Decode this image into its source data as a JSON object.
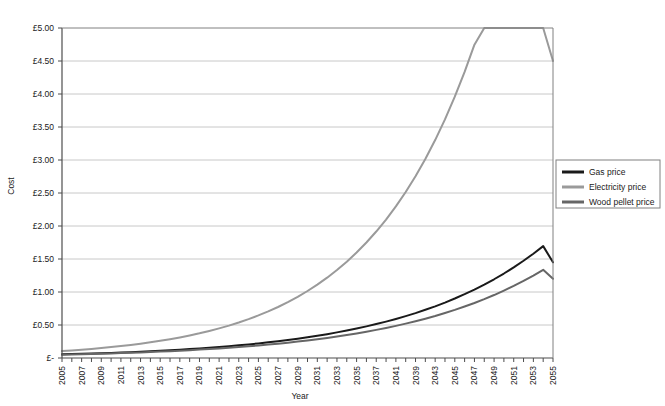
{
  "chart_data": {
    "type": "line",
    "title": "",
    "xlabel": "Year",
    "ylabel": "Cost",
    "ylim": [
      0,
      5
    ],
    "xlim": [
      2005,
      2055
    ],
    "grid": true,
    "grid_axis": "y",
    "legend_position": "right",
    "ytick_labels": [
      "£5.00",
      "£4.50",
      "£4.00",
      "£3.50",
      "£3.00",
      "£2.50",
      "£2.00",
      "£1.50",
      "£1.00",
      "£0.50",
      "£-"
    ],
    "ytick_values": [
      5.0,
      4.5,
      4.0,
      3.5,
      3.0,
      2.5,
      2.0,
      1.5,
      1.0,
      0.5,
      0.0
    ],
    "x": [
      2005,
      2006,
      2007,
      2008,
      2009,
      2010,
      2011,
      2012,
      2013,
      2014,
      2015,
      2016,
      2017,
      2018,
      2019,
      2020,
      2021,
      2022,
      2023,
      2024,
      2025,
      2026,
      2027,
      2028,
      2029,
      2030,
      2031,
      2032,
      2033,
      2034,
      2035,
      2036,
      2037,
      2038,
      2039,
      2040,
      2041,
      2042,
      2043,
      2044,
      2045,
      2046,
      2047,
      2048,
      2049,
      2050,
      2051,
      2052,
      2053,
      2054,
      2055
    ],
    "xtick_labels": [
      "2005",
      "2007",
      "2009",
      "2011",
      "2013",
      "2015",
      "2017",
      "2019",
      "2021",
      "2023",
      "2025",
      "2027",
      "2029",
      "2031",
      "2033",
      "2035",
      "2037",
      "2041",
      "2039",
      "2043",
      "2045",
      "2047",
      "2049",
      "2051",
      "2053",
      "2055"
    ],
    "series": [
      {
        "name": "Gas price",
        "color": "#1a1a1a",
        "values": [
          0.055,
          0.059,
          0.063,
          0.067,
          0.072,
          0.077,
          0.083,
          0.089,
          0.095,
          0.102,
          0.109,
          0.117,
          0.126,
          0.135,
          0.145,
          0.155,
          0.167,
          0.179,
          0.192,
          0.206,
          0.221,
          0.237,
          0.254,
          0.273,
          0.293,
          0.314,
          0.337,
          0.361,
          0.388,
          0.416,
          0.446,
          0.479,
          0.514,
          0.551,
          0.591,
          0.634,
          0.68,
          0.73,
          0.783,
          0.84,
          0.901,
          0.967,
          1.037,
          1.112,
          1.193,
          1.28,
          1.373,
          1.473,
          1.58,
          1.695,
          1.45
        ]
      },
      {
        "name": "Electricity price",
        "color": "#9a9a9a",
        "values": [
          0.105,
          0.115,
          0.126,
          0.138,
          0.151,
          0.165,
          0.181,
          0.198,
          0.217,
          0.238,
          0.26,
          0.285,
          0.312,
          0.342,
          0.374,
          0.41,
          0.449,
          0.491,
          0.538,
          0.589,
          0.645,
          0.706,
          0.773,
          0.847,
          0.927,
          1.015,
          1.112,
          1.217,
          1.333,
          1.459,
          1.598,
          1.75,
          1.916,
          2.098,
          2.297,
          2.515,
          2.754,
          3.015,
          3.302,
          3.615,
          3.959,
          4.335,
          4.747,
          5.198,
          5.692,
          6.233,
          6.825,
          7.473,
          8.183,
          8.96,
          4.5
        ]
      },
      {
        "name": "Wood pellet price",
        "color": "#666666",
        "values": [
          0.05,
          0.053,
          0.057,
          0.061,
          0.065,
          0.07,
          0.074,
          0.08,
          0.085,
          0.091,
          0.097,
          0.104,
          0.111,
          0.119,
          0.127,
          0.136,
          0.145,
          0.155,
          0.166,
          0.178,
          0.19,
          0.203,
          0.217,
          0.232,
          0.249,
          0.266,
          0.284,
          0.304,
          0.325,
          0.348,
          0.372,
          0.398,
          0.426,
          0.455,
          0.487,
          0.521,
          0.557,
          0.596,
          0.637,
          0.682,
          0.729,
          0.78,
          0.834,
          0.892,
          0.954,
          1.021,
          1.092,
          1.168,
          1.249,
          1.336,
          1.2
        ]
      }
    ]
  },
  "legend": {
    "items": [
      {
        "label": "Gas price",
        "color": "#1a1a1a"
      },
      {
        "label": "Electricity price",
        "color": "#9a9a9a"
      },
      {
        "label": "Wood pellet price",
        "color": "#666666"
      }
    ]
  },
  "axis_titles": {
    "x": "Year",
    "y": "Cost"
  }
}
